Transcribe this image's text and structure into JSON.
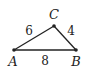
{
  "diagram": {
    "type": "triangle",
    "vertices": [
      {
        "name": "A",
        "x": 14,
        "y": 50,
        "label_x": 13,
        "label_y": 66
      },
      {
        "name": "B",
        "x": 76,
        "y": 50,
        "label_x": 76,
        "label_y": 66
      },
      {
        "name": "C",
        "x": 54,
        "y": 26,
        "label_x": 54,
        "label_y": 19
      }
    ],
    "sides": [
      {
        "from": "A",
        "to": "C",
        "length": "6",
        "label_x": 29,
        "label_y": 35
      },
      {
        "from": "C",
        "to": "B",
        "length": "4",
        "label_x": 71,
        "label_y": 35
      },
      {
        "from": "A",
        "to": "B",
        "length": "8",
        "label_x": 45,
        "label_y": 65
      }
    ],
    "stroke_color": "#222222"
  }
}
